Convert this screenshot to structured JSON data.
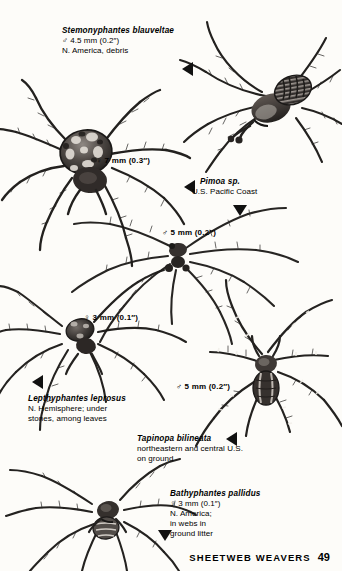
{
  "page": {
    "footer_title": "SHEETWEB WEAVERS",
    "page_number": "49",
    "background_color": "#fdfcf9",
    "ink_color": "#1c1a18"
  },
  "species": [
    {
      "id": "stemonyphantes-blauveltae",
      "name": "Stemonyphantes blauveltae",
      "lines": [
        "♂ 4.5 mm (0.2″)",
        "N. America, debris"
      ],
      "sex": "male",
      "size_mm": "4.5",
      "size_in": "0.2",
      "range": "N. America, debris"
    },
    {
      "id": "pimoa-sp",
      "name": "Pimoa sp.",
      "lines": [
        "U.S. Pacific Coast"
      ],
      "range": "U.S. Pacific Coast"
    },
    {
      "id": "lepthyphantes-leprosus",
      "name": "Lepthyphantes leprosus",
      "lines": [
        "N. Hemisphere; under",
        "stones, among leaves"
      ],
      "range": "N. Hemisphere; under stones, among leaves"
    },
    {
      "id": "tapinopa-bilineata",
      "name": "Tapinopa bilineata",
      "lines": [
        "northeastern and central U.S.",
        "on ground"
      ],
      "range": "northeastern and central U.S. on ground"
    },
    {
      "id": "bathyphantes-pallidus",
      "name": "Bathyphantes pallidus",
      "lines": [
        "♀ 3 mm (0.1″)",
        "N. America;",
        "in webs in",
        "ground litter"
      ],
      "sex": "female",
      "size_mm": "3",
      "size_in": "0.1",
      "range": "N. America; in webs in ground litter"
    }
  ],
  "measurements": {
    "female_7mm": "♀ 7 mm (0.3″)",
    "male_5mm_upper": "♂ 5 mm (0.2″)",
    "female_3mm": "♀ 3 mm (0.1″)",
    "male_5mm_lower": "♂ 5 mm (0.2″)"
  },
  "figures": [
    {
      "id": "fig-stemonyphantes",
      "label": "stemonyphantes-blauveltae-illustration"
    },
    {
      "id": "fig-pimoa-female",
      "label": "pimoa-female-illustration"
    },
    {
      "id": "fig-pimoa-male",
      "label": "pimoa-male-illustration"
    },
    {
      "id": "fig-lepthyphantes",
      "label": "lepthyphantes-leprosus-illustration"
    },
    {
      "id": "fig-tapinopa",
      "label": "tapinopa-bilineata-illustration"
    },
    {
      "id": "fig-bathyphantes",
      "label": "bathyphantes-pallidus-illustration"
    }
  ]
}
